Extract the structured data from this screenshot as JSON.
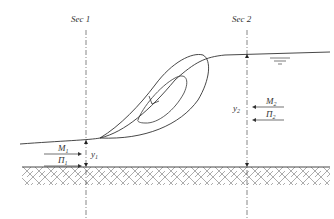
{
  "diagram": {
    "type": "hydraulic-jump-roller",
    "sections": [
      {
        "id": "sec1",
        "label": "Sec 1",
        "x": 86
      },
      {
        "id": "sec2",
        "label": "Sec 2",
        "x": 247
      }
    ],
    "depths": {
      "y1": {
        "symbol": "y",
        "sub": "1"
      },
      "y2": {
        "symbol": "y",
        "sub": "2"
      }
    },
    "forces": {
      "M1": {
        "symbol": "M",
        "sub": "1",
        "direction": "right"
      },
      "P1": {
        "symbol": "Π",
        "sub": "1",
        "direction": "right"
      },
      "M2": {
        "symbol": "M",
        "sub": "2",
        "direction": "left"
      },
      "P2": {
        "symbol": "Π",
        "sub": "2",
        "direction": "left"
      }
    },
    "free_surface_symbol": "water-level-triangle",
    "ground": {
      "pattern": "herringbone-hatch",
      "y": 167
    },
    "colors": {
      "line": "#333333",
      "hatch": "#8a8a8a",
      "background": "#ffffff"
    }
  }
}
